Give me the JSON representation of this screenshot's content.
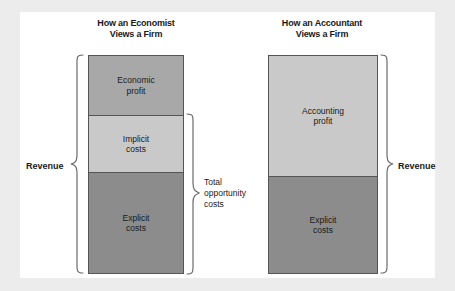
{
  "figure": {
    "background": "#ffffff",
    "page_background": "#ececec"
  },
  "columns": [
    {
      "title_line1": "How an Economist",
      "title_line2": "Views a Firm",
      "revenue_label": "Revenue",
      "segments": [
        {
          "line1": "Economic",
          "line2": "profit",
          "color": "#a8a8a8"
        },
        {
          "line1": "Implicit",
          "line2": "costs",
          "color": "#c9c9c9"
        },
        {
          "line1": "Explicit",
          "line2": "costs",
          "color": "#8c8c8c"
        }
      ]
    },
    {
      "title_line1": "How an Accountant",
      "title_line2": "Views a Firm",
      "revenue_label": "Revenue",
      "segments": [
        {
          "line1": "Accounting",
          "line2": "profit",
          "color": "#c9c9c9"
        },
        {
          "line1": "Explicit",
          "line2": "costs",
          "color": "#8c8c8c"
        }
      ]
    }
  ],
  "annotations": {
    "opportunity_line1": "Total",
    "opportunity_line2": "opportunity",
    "opportunity_line3": "costs"
  }
}
